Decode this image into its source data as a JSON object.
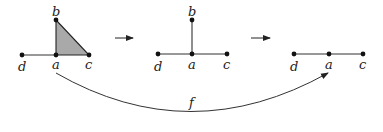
{
  "diagram": {
    "stages": [
      {
        "name": "stage-1",
        "vertices": {
          "b": [
            56,
            20
          ],
          "a": [
            56,
            55
          ],
          "c": [
            89,
            55
          ],
          "d": [
            22,
            55
          ]
        },
        "edges": [
          [
            "d",
            "a"
          ],
          [
            "a",
            "c"
          ],
          [
            "a",
            "b"
          ],
          [
            "b",
            "c"
          ]
        ],
        "filled_triangle": [
          "a",
          "b",
          "c"
        ],
        "fill_color": "#a9a9a9",
        "labels": {
          "b": "b",
          "a": "a",
          "c": "c",
          "d": "d"
        }
      },
      {
        "name": "stage-2",
        "vertices": {
          "b": [
            192,
            20
          ],
          "a": [
            192,
            54
          ],
          "c": [
            227,
            54
          ],
          "d": [
            158,
            54
          ]
        },
        "edges": [
          [
            "d",
            "a"
          ],
          [
            "a",
            "c"
          ],
          [
            "a",
            "b"
          ]
        ],
        "labels": {
          "b": "b",
          "a": "a",
          "c": "c",
          "d": "d"
        }
      },
      {
        "name": "stage-3",
        "vertices": {
          "d": [
            294,
            54
          ],
          "a": [
            329,
            54
          ],
          "c": [
            363,
            54
          ]
        },
        "edges": [
          [
            "d",
            "a"
          ],
          [
            "a",
            "c"
          ]
        ],
        "labels": {
          "d": "d",
          "a": "a",
          "c": "c"
        }
      }
    ],
    "arrows": [
      {
        "from": [
          115,
          38
        ],
        "to": [
          133,
          38
        ],
        "label": "→"
      },
      {
        "from": [
          251,
          38
        ],
        "to": [
          270,
          38
        ],
        "label": "→"
      }
    ],
    "map": {
      "label": "f",
      "from_vertex": "stage-1.a",
      "to_vertex": "stage-3.a"
    }
  }
}
